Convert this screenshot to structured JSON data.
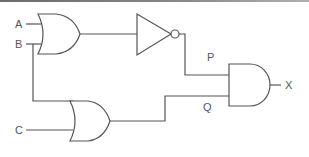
{
  "diagram": {
    "type": "logic-circuit",
    "inputs": [
      {
        "id": "A",
        "label": "A"
      },
      {
        "id": "B",
        "label": "B"
      },
      {
        "id": "C",
        "label": "C"
      }
    ],
    "intermediate": [
      {
        "id": "P",
        "label": "P"
      },
      {
        "id": "Q",
        "label": "Q"
      }
    ],
    "output": {
      "id": "X",
      "label": "X"
    },
    "gates": [
      {
        "id": "or1",
        "type": "OR",
        "inputs": [
          "A",
          "B"
        ],
        "output": "or1_out"
      },
      {
        "id": "not1",
        "type": "NOT",
        "inputs": [
          "or1_out"
        ],
        "output": "P"
      },
      {
        "id": "or2",
        "type": "OR",
        "inputs": [
          "B",
          "C"
        ],
        "output": "Q"
      },
      {
        "id": "and1",
        "type": "AND",
        "inputs": [
          "P",
          "Q"
        ],
        "output": "X"
      }
    ],
    "expression": "X = NOT(A OR B) AND (B OR C)"
  },
  "colors": {
    "line": "#555555",
    "background": "#ffffff"
  }
}
